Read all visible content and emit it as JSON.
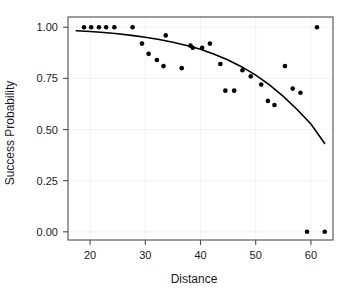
{
  "chart_data": {
    "type": "scatter",
    "title": "",
    "xlabel": "Distance",
    "ylabel": "Success Probability",
    "xlim": [
      16.0,
      64.0
    ],
    "ylim": [
      -0.04,
      1.05
    ],
    "xticks": [
      20,
      30,
      40,
      50,
      60
    ],
    "xtick_labels": [
      "20",
      "30",
      "40",
      "50",
      "60"
    ],
    "yticks": [
      0.0,
      0.25,
      0.5,
      0.75,
      1.0
    ],
    "ytick_labels": [
      "0.00",
      "0.25",
      "0.50",
      "0.75",
      "1.00"
    ],
    "grid": true,
    "legend": "none",
    "series": [
      {
        "name": "Observed success proportion",
        "type": "scatter",
        "marker": "filled-circle",
        "color": "#000000",
        "points": [
          [
            18.9,
            1.0
          ],
          [
            20.2,
            1.0
          ],
          [
            21.6,
            1.0
          ],
          [
            22.9,
            1.0
          ],
          [
            24.4,
            1.0
          ],
          [
            27.7,
            1.0
          ],
          [
            29.4,
            0.92
          ],
          [
            30.6,
            0.87
          ],
          [
            32.1,
            0.84
          ],
          [
            33.3,
            0.81
          ],
          [
            33.7,
            0.96
          ],
          [
            36.6,
            0.8
          ],
          [
            38.2,
            0.91
          ],
          [
            38.6,
            0.9
          ],
          [
            40.3,
            0.9
          ],
          [
            41.7,
            0.92
          ],
          [
            43.6,
            0.82
          ],
          [
            44.5,
            0.69
          ],
          [
            46.1,
            0.69
          ],
          [
            47.6,
            0.79
          ],
          [
            49.1,
            0.76
          ],
          [
            51.0,
            0.72
          ],
          [
            52.2,
            0.64
          ],
          [
            53.4,
            0.62
          ],
          [
            55.3,
            0.81
          ],
          [
            56.7,
            0.7
          ],
          [
            58.1,
            0.68
          ],
          [
            59.3,
            0.0
          ],
          [
            61.1,
            1.0
          ],
          [
            62.5,
            0.0
          ]
        ]
      },
      {
        "name": "Fitted logistic curve",
        "type": "line",
        "color": "#000000",
        "points": [
          [
            17.5,
            0.983
          ],
          [
            20.0,
            0.979
          ],
          [
            22.5,
            0.974
          ],
          [
            25.0,
            0.968
          ],
          [
            27.5,
            0.96
          ],
          [
            30.0,
            0.951
          ],
          [
            32.5,
            0.94
          ],
          [
            35.0,
            0.927
          ],
          [
            37.5,
            0.911
          ],
          [
            40.0,
            0.892
          ],
          [
            42.5,
            0.868
          ],
          [
            45.0,
            0.84
          ],
          [
            47.5,
            0.806
          ],
          [
            50.0,
            0.766
          ],
          [
            52.5,
            0.718
          ],
          [
            55.0,
            0.662
          ],
          [
            57.5,
            0.598
          ],
          [
            60.0,
            0.527
          ],
          [
            62.5,
            0.432
          ]
        ]
      }
    ]
  }
}
